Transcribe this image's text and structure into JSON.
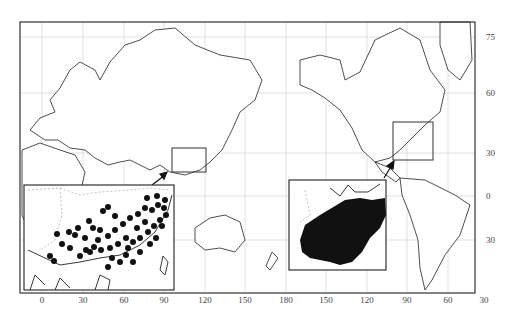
{
  "figure": {
    "type": "world distribution map",
    "projection": "Pacific-centered equirectangular",
    "insets": [
      {
        "name": "East Asia (southern China) distribution",
        "marker": "dots",
        "region_box_on_main_map": "southern China / Indochina"
      },
      {
        "name": "Eastern North America distribution",
        "marker": "filled area",
        "region_box_on_main_map": "eastern United States"
      }
    ]
  },
  "axes": {
    "x_ticks": [
      "0",
      "30",
      "60",
      "90",
      "120",
      "150",
      "180",
      "150",
      "120",
      "90",
      "60",
      "30"
    ],
    "y_ticks": [
      "75",
      "60",
      "30",
      "0",
      "30"
    ]
  },
  "colors": {
    "frame": "#333333",
    "coast": "#222222",
    "grid": "#cccccc",
    "fill": "#111111"
  }
}
